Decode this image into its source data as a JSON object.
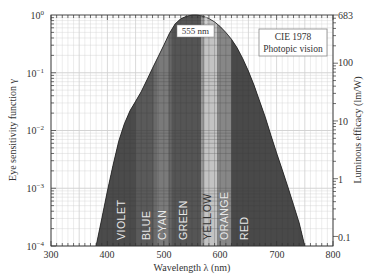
{
  "chart_data": {
    "type": "area",
    "title": "",
    "legend_box": {
      "line1": "CIE 1978",
      "line2": "Photopic vision"
    },
    "peak_annotation": "555 nm",
    "xlabel": "Wavelength λ (nm)",
    "ylabel": "Eye sensitivity function γ",
    "ylabel_right": "Luminous efficacy (lm/W)",
    "xlim": [
      300,
      800
    ],
    "ylim": [
      0.0001,
      1
    ],
    "yscale": "log",
    "grid": true,
    "x_ticks": [
      "300",
      "400",
      "500",
      "600",
      "700",
      "800"
    ],
    "y_ticks_left": [
      "10⁰",
      "10⁻¹",
      "10⁻²",
      "10⁻³",
      "10⁻⁴"
    ],
    "y_ticks_right": [
      "683",
      "100",
      "10",
      "1",
      "0.1"
    ],
    "x": [
      380,
      390,
      400,
      410,
      420,
      430,
      440,
      450,
      460,
      470,
      480,
      490,
      500,
      510,
      520,
      530,
      540,
      550,
      555,
      560,
      570,
      580,
      590,
      600,
      610,
      620,
      630,
      640,
      650,
      660,
      670,
      680,
      690,
      700,
      710,
      720,
      730,
      740,
      750
    ],
    "series": [
      {
        "name": "Eye sensitivity function (CIE 1978 photopic)",
        "values": [
          0.0001,
          0.0003,
          0.0009,
          0.0025,
          0.0065,
          0.013,
          0.022,
          0.032,
          0.047,
          0.075,
          0.12,
          0.19,
          0.3,
          0.48,
          0.7,
          0.86,
          0.95,
          0.995,
          1.0,
          0.995,
          0.95,
          0.87,
          0.76,
          0.63,
          0.5,
          0.38,
          0.27,
          0.175,
          0.107,
          0.061,
          0.032,
          0.017,
          0.0082,
          0.0041,
          0.0021,
          0.00105,
          0.00052,
          0.00025,
          0.0001
        ]
      }
    ],
    "color_bands": [
      {
        "label": "VIOLET",
        "from": 380,
        "to": 450
      },
      {
        "label": "BLUE",
        "from": 450,
        "to": 485
      },
      {
        "label": "CYAN",
        "from": 485,
        "to": 510
      },
      {
        "label": "GREEN",
        "from": 510,
        "to": 570
      },
      {
        "label": "YELLOW",
        "from": 570,
        "to": 595
      },
      {
        "label": "ORANGE",
        "from": 595,
        "to": 620
      },
      {
        "label": "RED",
        "from": 620,
        "to": 750
      }
    ]
  },
  "labels": {
    "legend_line1": "CIE 1978",
    "legend_line2": "Photopic vision",
    "peak": "555 nm",
    "xlabel": "Wavelength λ (nm)",
    "ylabel": "Eye sensitivity function γ",
    "ylabel_right": "Luminous efficacy (lm/W)",
    "x_ticks": [
      "300",
      "400",
      "500",
      "600",
      "700",
      "800"
    ],
    "y_left": {
      "e0": "10",
      "e0s": "0",
      "e1": "10",
      "e1s": "−1",
      "e2": "10",
      "e2s": "−2",
      "e3": "10",
      "e3s": "−3",
      "e4": "10",
      "e4s": "−4"
    },
    "y_right": [
      "683",
      "100",
      "10",
      "1",
      "0.1"
    ],
    "bands": [
      "VIOLET",
      "BLUE",
      "CYAN",
      "GREEN",
      "YELLOW",
      "ORANGE",
      "RED"
    ]
  },
  "colors": {
    "band_base": "#4a4a4a",
    "violet": "#4b4b4b",
    "blue": "#5a5a5a",
    "cyan": "#7a7a7a",
    "green": "#555555",
    "yellow": "#c4c4c4",
    "orange": "#888888",
    "red": "#4a4a4a",
    "grid": "#c8c8c8"
  }
}
